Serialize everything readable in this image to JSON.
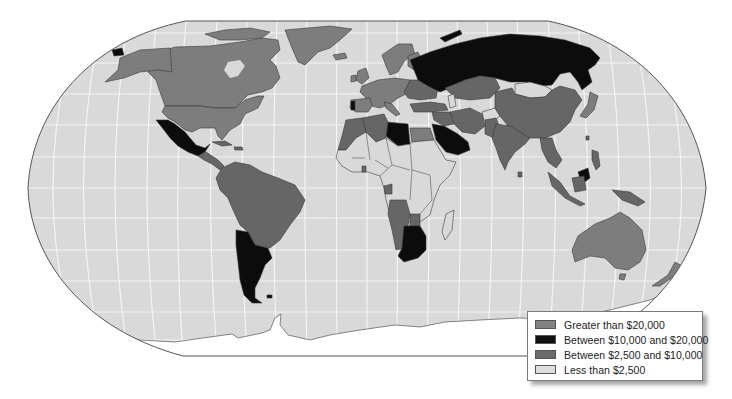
{
  "map": {
    "type": "choropleth",
    "projection": "Robinson",
    "colors": {
      "ocean": "#d9d9d9",
      "grid": "#f4f4f4",
      "border": "#3a3a3a",
      "antarctica": "#ffffff"
    },
    "categories": {
      "gt20000": "#7d7d7d",
      "10000to20000": "#0c0c0c",
      "2500to10000": "#666666",
      "lt2500": "#d9d9d9"
    }
  },
  "legend": {
    "items": [
      {
        "key": "gt20000",
        "label": "Greater than $20,000",
        "color": "#838383"
      },
      {
        "key": "10000to20000",
        "label": "Between $10,000 and $20,000",
        "color": "#111111"
      },
      {
        "key": "2500to10000",
        "label": "Between $2,500 and $10,000",
        "color": "#6a6a6a"
      },
      {
        "key": "lt2500",
        "label": "Less than $2,500",
        "color": "#dedede"
      }
    ]
  }
}
